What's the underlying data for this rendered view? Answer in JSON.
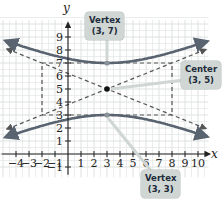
{
  "chart_data": {
    "type": "line",
    "title": "",
    "xlabel": "x",
    "ylabel": "y",
    "xlim": [
      -5,
      11
    ],
    "ylim": [
      -1.5,
      10
    ],
    "grid": true,
    "x_ticks": [
      -4,
      -3,
      -2,
      -1,
      1,
      2,
      3,
      4,
      5,
      6,
      7,
      8,
      9,
      10
    ],
    "y_ticks": [
      -1,
      1,
      2,
      3,
      4,
      5,
      6,
      7,
      8,
      9
    ],
    "x_tick_labels": [
      "-4",
      "-3",
      "-2",
      "-1",
      "1",
      "2",
      "3",
      "4",
      "5",
      "6",
      "7",
      "8",
      "9",
      "10"
    ],
    "y_tick_labels": [
      "-1",
      "1",
      "2",
      "3",
      "4",
      "5",
      "6",
      "7",
      "8",
      "9"
    ],
    "equation": "(y-5)^2/4 - (x-3)^2/25 = 1",
    "center": [
      3,
      5
    ],
    "vertices": [
      [
        3,
        7
      ],
      [
        3,
        3
      ]
    ],
    "a": 2,
    "b": 5,
    "rectangle": {
      "x": [
        -2,
        8
      ],
      "y": [
        3,
        7
      ]
    },
    "asymptotes": [
      {
        "slope": 0.4,
        "point": [
          3,
          5
        ]
      },
      {
        "slope": -0.4,
        "point": [
          3,
          5
        ]
      }
    ],
    "series": [
      {
        "name": "upper branch",
        "style": "solid",
        "color": "#5a6470"
      },
      {
        "name": "lower branch",
        "style": "solid",
        "color": "#5a6470"
      },
      {
        "name": "asymptotes",
        "style": "dashed",
        "color": "#555555"
      },
      {
        "name": "rectangle",
        "style": "dashed",
        "color": "#555555"
      }
    ],
    "annotations": [
      {
        "label": "Vertex (3, 7)",
        "point": [
          3,
          7
        ]
      },
      {
        "label": "Center (3, 5)",
        "point": [
          3,
          5
        ]
      },
      {
        "label": "Vertex (3, 3)",
        "point": [
          3,
          3
        ]
      }
    ]
  },
  "labels": {
    "x_axis": "x",
    "y_axis": "y",
    "vertex_top": {
      "line1": "Vertex",
      "line2": "(3, 7)"
    },
    "center": {
      "line1": "Center",
      "line2": "(3, 5)"
    },
    "vertex_bottom": {
      "line1": "Vertex",
      "line2": "(3, 3)"
    }
  },
  "colors": {
    "curve": "#5a6470",
    "dashed": "#555555",
    "grid": "#dde2e0",
    "axis": "#222222",
    "callout_bg": "#cfd6d3",
    "callout_text": "#1c2a3a",
    "point": "#111111"
  }
}
